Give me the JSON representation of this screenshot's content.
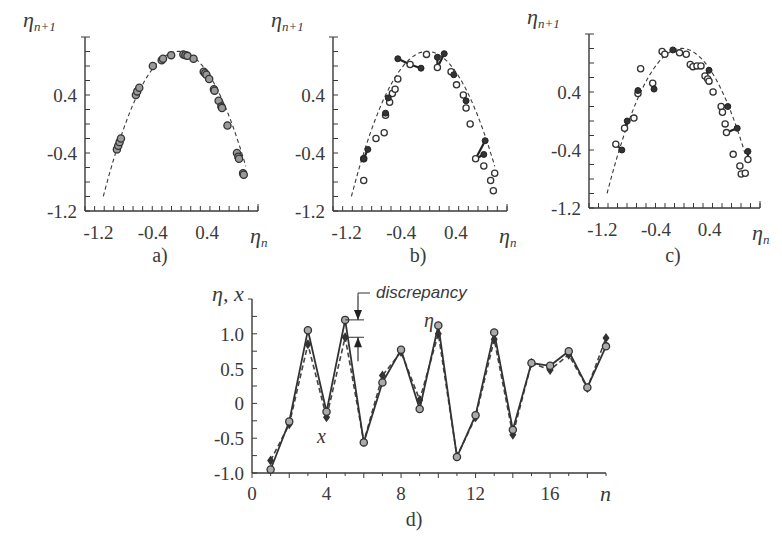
{
  "chart_data": [
    {
      "id": "a",
      "type": "scatter",
      "panel_label": "a)",
      "title": "",
      "xlabel": "η_n",
      "ylabel": "η_{n+1}",
      "xticks": [
        -1.2,
        -0.4,
        0.4
      ],
      "yticks": [
        0.4,
        -0.4,
        -1.2
      ],
      "xlim": [
        -1.35,
        1.2
      ],
      "ylim": [
        -1.2,
        1.2
      ],
      "fit_curve": {
        "style": "dashed",
        "description": "parabola η_{n+1} = 1 - 1.9 η_n^2 (approx)",
        "x_range": [
          -1.05,
          1.05
        ]
      },
      "series": [
        {
          "name": "data (η_n, η_{n+1})",
          "marker": "circle",
          "points": [
            [
              -0.88,
              -0.35
            ],
            [
              -0.86,
              -0.3
            ],
            [
              -0.84,
              -0.25
            ],
            [
              -0.82,
              -0.2
            ],
            [
              -0.6,
              0.4
            ],
            [
              -0.58,
              0.45
            ],
            [
              -0.55,
              0.5
            ],
            [
              -0.35,
              0.8
            ],
            [
              -0.22,
              0.88
            ],
            [
              -0.2,
              0.9
            ],
            [
              -0.08,
              0.95
            ],
            [
              0.1,
              0.96
            ],
            [
              0.13,
              0.95
            ],
            [
              0.16,
              0.94
            ],
            [
              0.25,
              0.9
            ],
            [
              0.4,
              0.72
            ],
            [
              0.42,
              0.7
            ],
            [
              0.44,
              0.68
            ],
            [
              0.48,
              0.62
            ],
            [
              0.55,
              0.48
            ],
            [
              0.56,
              0.46
            ],
            [
              0.62,
              0.32
            ],
            [
              0.66,
              0.24
            ],
            [
              0.67,
              0.22
            ],
            [
              0.75,
              -0.02
            ],
            [
              0.89,
              -0.4
            ],
            [
              0.91,
              -0.45
            ],
            [
              0.92,
              -0.48
            ],
            [
              0.98,
              -0.68
            ],
            [
              0.99,
              -0.7
            ]
          ]
        }
      ]
    },
    {
      "id": "b",
      "type": "scatter",
      "panel_label": "b)",
      "title": "",
      "xlabel": "η_n",
      "ylabel": "η_{n+1}",
      "xticks": [
        -1.2,
        -0.4,
        0.4
      ],
      "yticks": [
        0.4,
        -0.4,
        -1.2
      ],
      "xlim": [
        -1.35,
        1.2
      ],
      "ylim": [
        -1.2,
        1.2
      ],
      "fit_curve": {
        "style": "dashed",
        "x_range": [
          -1.05,
          1.05
        ]
      },
      "series": [
        {
          "name": "measured",
          "marker": "open-circle",
          "points": [
            [
              -0.9,
              -0.78
            ],
            [
              -0.9,
              -0.48
            ],
            [
              -0.72,
              -0.2
            ],
            [
              -0.6,
              -0.12
            ],
            [
              -0.58,
              0.12
            ],
            [
              -0.52,
              0.3
            ],
            [
              -0.48,
              0.42
            ],
            [
              -0.44,
              0.48
            ],
            [
              -0.4,
              0.62
            ],
            [
              -0.22,
              0.82
            ],
            [
              0.02,
              0.96
            ],
            [
              0.18,
              0.78
            ],
            [
              0.38,
              0.72
            ],
            [
              0.46,
              0.54
            ],
            [
              0.56,
              0.4
            ],
            [
              0.6,
              0.22
            ],
            [
              0.66,
              0.0
            ],
            [
              0.74,
              -0.48
            ],
            [
              0.86,
              -0.58
            ],
            [
              0.96,
              -0.78
            ],
            [
              1.0,
              -0.92
            ],
            [
              1.02,
              -0.68
            ]
          ]
        },
        {
          "name": "model",
          "marker": "filled-circle",
          "points": [
            [
              -0.9,
              -0.48
            ],
            [
              -0.84,
              -0.35
            ],
            [
              -0.58,
              0.15
            ],
            [
              -0.54,
              0.36
            ],
            [
              -0.4,
              0.9
            ],
            [
              -0.06,
              0.77
            ],
            [
              0.18,
              0.92
            ],
            [
              0.28,
              0.97
            ],
            [
              0.42,
              0.68
            ],
            [
              0.6,
              0.32
            ],
            [
              0.86,
              -0.42
            ],
            [
              0.88,
              -0.23
            ]
          ]
        }
      ],
      "discrepancy_segments": "vertical bars join measured and model values"
    },
    {
      "id": "c",
      "type": "scatter",
      "panel_label": "c)",
      "title": "",
      "xlabel": "η_n",
      "ylabel": "η_{n+1}",
      "xticks": [
        -1.2,
        -0.4,
        0.4
      ],
      "yticks": [
        0.4,
        -0.4,
        -1.2
      ],
      "xlim": [
        -1.35,
        1.2
      ],
      "ylim": [
        -1.2,
        1.2
      ],
      "fit_curve": {
        "style": "dashed",
        "x_range": [
          -1.05,
          1.05
        ]
      },
      "series": [
        {
          "name": "measured",
          "marker": "open-circle",
          "points": [
            [
              -0.95,
              -0.32
            ],
            [
              -0.82,
              -0.1
            ],
            [
              -0.68,
              0.04
            ],
            [
              -0.62,
              0.38
            ],
            [
              -0.58,
              0.72
            ],
            [
              -0.4,
              0.52
            ],
            [
              -0.26,
              0.96
            ],
            [
              -0.22,
              0.92
            ],
            [
              0.0,
              0.94
            ],
            [
              0.1,
              0.92
            ],
            [
              0.16,
              0.78
            ],
            [
              0.2,
              0.75
            ],
            [
              0.26,
              0.76
            ],
            [
              0.32,
              0.76
            ],
            [
              0.38,
              0.62
            ],
            [
              0.42,
              0.58
            ],
            [
              0.44,
              0.55
            ],
            [
              0.5,
              0.4
            ],
            [
              0.62,
              0.2
            ],
            [
              0.64,
              0.12
            ],
            [
              0.68,
              -0.04
            ],
            [
              0.7,
              -0.16
            ],
            [
              0.8,
              -0.46
            ],
            [
              0.9,
              -0.62
            ],
            [
              0.92,
              -0.73
            ],
            [
              0.98,
              -0.72
            ],
            [
              1.02,
              -0.53
            ]
          ]
        },
        {
          "name": "model",
          "marker": "filled-circle",
          "points": [
            [
              -0.86,
              -0.4
            ],
            [
              -0.78,
              0.0
            ],
            [
              -0.62,
              0.42
            ],
            [
              -0.38,
              0.44
            ],
            [
              -0.1,
              0.98
            ],
            [
              0.44,
              0.7
            ],
            [
              0.72,
              0.2
            ],
            [
              0.86,
              -0.1
            ],
            [
              1.02,
              -0.42
            ]
          ]
        }
      ],
      "discrepancy_segments": "slanted bars join measured and model values"
    },
    {
      "id": "d",
      "type": "line",
      "panel_label": "d)",
      "title": "",
      "xlabel": "n",
      "ylabel": "η, x",
      "xticks": [
        0,
        4,
        8,
        12,
        16
      ],
      "yticks": [
        1.0,
        0.5,
        0,
        -0.5,
        -1.0
      ],
      "xlim": [
        0,
        19
      ],
      "ylim": [
        -1.0,
        1.5
      ],
      "categories": [
        1,
        2,
        3,
        4,
        5,
        6,
        7,
        8,
        9,
        10,
        11,
        12,
        13,
        14,
        15,
        16,
        17,
        18,
        19
      ],
      "series": [
        {
          "name": "η",
          "style": "solid",
          "marker": "open-circle",
          "values": [
            -0.95,
            -0.26,
            1.05,
            -0.12,
            1.2,
            -0.56,
            0.3,
            0.77,
            -0.08,
            1.12,
            -0.77,
            -0.17,
            1.02,
            -0.38,
            0.58,
            0.54,
            0.75,
            0.23,
            0.82,
            -0.32
          ]
        },
        {
          "name": "x",
          "style": "dashed",
          "marker": "filled-diamond",
          "values": [
            -0.82,
            -0.3,
            0.85,
            -0.2,
            0.95,
            -0.55,
            0.4,
            0.74,
            0.05,
            1.0,
            -0.76,
            -0.2,
            0.92,
            -0.45,
            0.58,
            0.48,
            0.7,
            0.22,
            0.94,
            -0.5
          ]
        }
      ],
      "annotations": [
        {
          "text": "discrepancy",
          "near_n": 5,
          "description": "bracket showing gap between η and x at n=5"
        },
        {
          "text": "η",
          "near_n": 10,
          "near_value": 1.25
        },
        {
          "text": "x",
          "near_n": 4,
          "near_value": -0.5
        }
      ]
    }
  ],
  "labels": {
    "eta_n": "η",
    "eta_n_sub": "n",
    "eta_n1": "η",
    "eta_n1_sub": "n+1",
    "panel_d_ylabel": "η, x",
    "panel_d_xlabel": "n",
    "discrepancy": "discrepancy",
    "eta": "η",
    "x": "x"
  }
}
